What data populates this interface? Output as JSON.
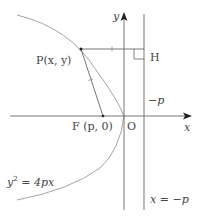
{
  "diagram": {
    "axes": {
      "x_label": "x",
      "y_label": "y",
      "origin_label": "O"
    },
    "points": {
      "P": "P(x,  y)",
      "F": "F (p,  0)",
      "H": "H"
    },
    "labels": {
      "neg_p": "−p",
      "equation": "y² = 4px",
      "eq_lhs": "y",
      "eq_exp": "2",
      "eq_rhs": " = 4px",
      "directrix": "x = −p"
    },
    "colors": {
      "line": "#666666",
      "curve": "#999999",
      "text": "#444444"
    }
  }
}
